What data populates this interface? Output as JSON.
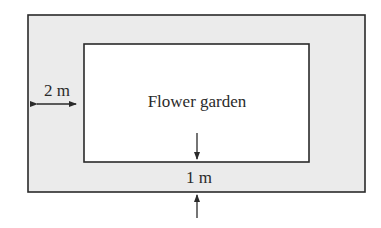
{
  "diagram": {
    "type": "labeled rectangle with border path",
    "garden_label": "Flower garden",
    "side_width_label": "2 m",
    "bottom_width_label": "1 m",
    "colors": {
      "path_fill": "#ebebeb",
      "garden_fill": "#ffffff",
      "stroke": "#2a2a2a"
    }
  }
}
